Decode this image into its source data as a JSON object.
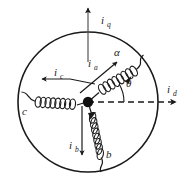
{
  "figure": {
    "kind": "three-phase-winding-axes-diagram",
    "background_color": "#ffffff",
    "stroke_color": "#1a1a1a",
    "hub_color": "#111111"
  },
  "stator": {
    "label": "stator-circle",
    "center_x": 88,
    "center_y": 102,
    "radius": 70,
    "stroke_width": 1.6
  },
  "hub": {
    "label": "neutral-point",
    "x": 88,
    "y": 102,
    "radius": 5.2
  },
  "axes": {
    "q_axis": {
      "name": "q-axis",
      "label": "i",
      "subscript": "q",
      "label_x": 101,
      "label_y": 24,
      "sub_x": 107,
      "sub_y": 27,
      "style": "solid",
      "direction": "up"
    },
    "d_axis": {
      "name": "d-axis",
      "label": "i",
      "subscript": "d",
      "label_x": 167,
      "label_y": 93,
      "sub_x": 172,
      "sub_y": 96,
      "style": "dashed",
      "direction": "right"
    }
  },
  "phases": [
    {
      "id": "a",
      "axis_label": "α",
      "axis_label_x": 114,
      "axis_label_y": 55,
      "current_label": "i",
      "current_subscript": "a",
      "current_label_x": 89,
      "current_label_y": 66,
      "current_sub_x": 94,
      "current_sub_y": 69,
      "angle_deg": 30,
      "description": "phase-a-winding-upper-right"
    },
    {
      "id": "b",
      "axis_label": "b",
      "axis_label_x": 106,
      "axis_label_y": 157,
      "current_label": "i",
      "current_subscript": "b",
      "current_label_x": 71,
      "current_label_y": 148,
      "current_sub_x": 76,
      "current_sub_y": 151,
      "angle_deg": -80,
      "description": "phase-b-winding-lower"
    },
    {
      "id": "c",
      "axis_label": "c",
      "axis_label_x": 24,
      "axis_label_y": 113,
      "current_label": "i",
      "current_subscript": "c",
      "current_label_x": 54,
      "current_label_y": 79,
      "current_sub_x": 59,
      "current_sub_y": 82,
      "angle_deg": 180,
      "description": "phase-c-winding-left"
    }
  ],
  "angle_marker": {
    "name": "theta-angle",
    "symbol": "θ",
    "label_x": 126,
    "label_y": 85,
    "arc_radius": 36,
    "from_deg": 0,
    "to_deg": 30
  }
}
